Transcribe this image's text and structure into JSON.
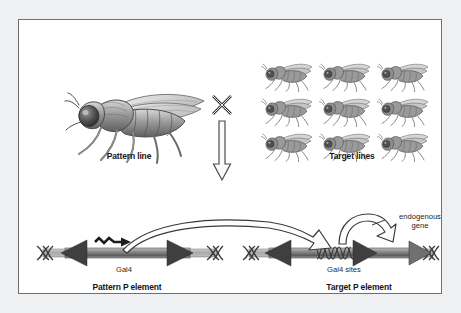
{
  "figure": {
    "type": "genetic-cross-diagram",
    "topic": "GAL4/UAS enhancer trap system in Drosophila",
    "background_color": "#eef0f1",
    "panel_color": "#ffffff",
    "border_color": "#6d7073"
  },
  "cross": {
    "pattern_line_label": "Pattern line",
    "target_lines_label": "Target lines",
    "cross_symbol": "cross-symbol",
    "down_arrow": "down-arrow",
    "pattern_fly_count": 1,
    "target_fly_count": 9,
    "target_grid_rows": 3,
    "target_grid_cols": 3
  },
  "pattern_element": {
    "caption": "Pattern P element",
    "gene_label": "Gal4",
    "left_terminus": "dna-helix",
    "right_terminus": "dna-helix",
    "promoter": "zigzag-arrow"
  },
  "target_element": {
    "caption": "Target P element",
    "binding_sites_label": "Gal4 sites",
    "endogenous_gene_label_line1": "endogenous",
    "endogenous_gene_label_line2": "gene",
    "left_terminus": "dna-helix",
    "right_terminus": "dna-helix"
  },
  "arrows": {
    "transactivation": "curved-activation-arrow",
    "transcription": "curved-transcription-arrow"
  },
  "colors": {
    "dna_dark": "#4a4a4a",
    "dna_mid": "#8d8d8d",
    "dna_light": "#c9c9c9",
    "arrow_outline": "#3a3a3a",
    "text": "#161616"
  }
}
